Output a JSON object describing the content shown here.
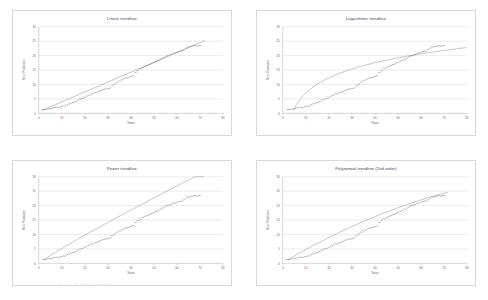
{
  "figure": {
    "caption": "Figure 1. Trendline comparison",
    "panel_count": 4
  },
  "axis": {
    "xlabel": "Years",
    "ylabel": "New Positions",
    "x_ticks": [
      "0",
      "10",
      "20",
      "30",
      "40",
      "50",
      "60",
      "70",
      "80"
    ],
    "y_ticks": [
      "0",
      "5",
      "10",
      "15",
      "20",
      "25",
      "30"
    ],
    "xlim": [
      0,
      80
    ],
    "ylim": [
      0,
      30
    ],
    "gridline_color": "#c8c8c8",
    "axis_color": "#9a9a9a",
    "marker_color": "#3a3a3a",
    "trendline_color": "#7d7d7d"
  },
  "chart_data": [
    {
      "type": "scatter",
      "title": "Linear trendline",
      "xlabel": "Years",
      "ylabel": "New Positions",
      "xlim": [
        0,
        80
      ],
      "ylim": [
        0,
        30
      ],
      "grid": true,
      "legend": "none",
      "trend": "linear",
      "x": [
        2,
        3,
        4,
        5,
        6,
        7,
        8,
        9,
        10,
        11,
        12,
        13,
        14,
        15,
        16,
        17,
        18,
        19,
        20,
        21,
        22,
        23,
        24,
        25,
        26,
        27,
        28,
        29,
        30,
        31,
        32,
        33,
        34,
        35,
        36,
        37,
        38,
        39,
        40,
        41,
        42,
        43,
        44,
        45,
        46,
        47,
        48,
        49,
        50,
        51,
        52,
        53,
        54,
        55,
        56,
        57,
        58,
        59,
        60,
        61,
        62,
        63,
        64,
        65,
        66,
        67,
        68,
        69,
        70
      ],
      "y": [
        1.3,
        1.4,
        1.5,
        1.6,
        1.8,
        2.0,
        2.1,
        2.2,
        2.3,
        2.5,
        2.9,
        3.2,
        3.5,
        3.8,
        4.0,
        4.6,
        5.0,
        5.2,
        5.6,
        6.0,
        6.3,
        6.7,
        7.0,
        7.2,
        7.6,
        8.0,
        8.2,
        8.4,
        8.6,
        8.8,
        9.6,
        10.2,
        10.8,
        11.2,
        11.6,
        12.0,
        12.3,
        12.5,
        12.7,
        13.0,
        14.2,
        14.8,
        15.4,
        15.8,
        16.2,
        16.6,
        16.9,
        17.2,
        17.6,
        18.0,
        18.4,
        18.8,
        19.2,
        19.6,
        20.0,
        20.3,
        20.6,
        20.9,
        21.2,
        21.4,
        21.6,
        22.0,
        22.6,
        23.0,
        23.2,
        23.3,
        23.4,
        23.4,
        23.5
      ],
      "trendline": {
        "kind": "linear",
        "y_start": 0.9,
        "y_end": 25.2
      }
    },
    {
      "type": "scatter",
      "title": "Logarithmic trendline",
      "xlabel": "Years",
      "ylabel": "New Positions",
      "xlim": [
        0,
        80
      ],
      "ylim": [
        0,
        30
      ],
      "grid": true,
      "legend": "none",
      "trend": "logarithmic",
      "x": [
        2,
        3,
        4,
        5,
        6,
        7,
        8,
        9,
        10,
        11,
        12,
        13,
        14,
        15,
        16,
        17,
        18,
        19,
        20,
        21,
        22,
        23,
        24,
        25,
        26,
        27,
        28,
        29,
        30,
        31,
        32,
        33,
        34,
        35,
        36,
        37,
        38,
        39,
        40,
        41,
        42,
        43,
        44,
        45,
        46,
        47,
        48,
        49,
        50,
        51,
        52,
        53,
        54,
        55,
        56,
        57,
        58,
        59,
        60,
        61,
        62,
        63,
        64,
        65,
        66,
        67,
        68,
        69,
        70
      ],
      "y": [
        1.3,
        1.4,
        1.5,
        1.6,
        1.8,
        2.0,
        2.1,
        2.2,
        2.3,
        2.5,
        2.9,
        3.2,
        3.5,
        3.8,
        4.0,
        4.6,
        5.0,
        5.2,
        5.6,
        6.0,
        6.3,
        6.7,
        7.0,
        7.2,
        7.6,
        8.0,
        8.2,
        8.4,
        8.6,
        8.8,
        9.6,
        10.2,
        10.8,
        11.2,
        11.6,
        12.0,
        12.3,
        12.5,
        12.7,
        13.0,
        14.2,
        14.8,
        15.4,
        15.8,
        16.2,
        16.6,
        16.9,
        17.2,
        17.6,
        18.0,
        18.4,
        18.8,
        19.2,
        19.6,
        20.0,
        20.3,
        20.6,
        20.9,
        21.2,
        21.4,
        21.6,
        22.0,
        22.6,
        23.0,
        23.2,
        23.3,
        23.4,
        23.4,
        23.5
      ],
      "trendline": {
        "kind": "logarithmic",
        "coef_a": 7.6,
        "coef_b": -10.5,
        "x_start": 4.5,
        "x_end": 80
      }
    },
    {
      "type": "scatter",
      "title": "Power trendline",
      "xlabel": "Years",
      "ylabel": "New Positions",
      "xlim": [
        0,
        80
      ],
      "ylim": [
        0,
        30
      ],
      "grid": true,
      "legend": "none",
      "trend": "power",
      "x": [
        2,
        3,
        4,
        5,
        6,
        7,
        8,
        9,
        10,
        11,
        12,
        13,
        14,
        15,
        16,
        17,
        18,
        19,
        20,
        21,
        22,
        23,
        24,
        25,
        26,
        27,
        28,
        29,
        30,
        31,
        32,
        33,
        34,
        35,
        36,
        37,
        38,
        39,
        40,
        41,
        42,
        43,
        44,
        45,
        46,
        47,
        48,
        49,
        50,
        51,
        52,
        53,
        54,
        55,
        56,
        57,
        58,
        59,
        60,
        61,
        62,
        63,
        64,
        65,
        66,
        67,
        68,
        69,
        70
      ],
      "y": [
        1.3,
        1.4,
        1.5,
        1.6,
        1.8,
        2.0,
        2.1,
        2.2,
        2.3,
        2.5,
        2.9,
        3.2,
        3.5,
        3.8,
        4.0,
        4.6,
        5.0,
        5.2,
        5.6,
        6.0,
        6.3,
        6.7,
        7.0,
        7.2,
        7.6,
        8.0,
        8.2,
        8.4,
        8.6,
        8.8,
        9.6,
        10.2,
        10.8,
        11.2,
        11.6,
        12.0,
        12.3,
        12.5,
        12.7,
        13.0,
        14.2,
        14.8,
        15.4,
        15.8,
        16.2,
        16.6,
        16.9,
        17.2,
        17.6,
        18.0,
        18.4,
        18.8,
        19.2,
        19.6,
        20.0,
        20.3,
        20.6,
        20.9,
        21.2,
        21.4,
        21.6,
        22.0,
        22.6,
        23.0,
        23.2,
        23.3,
        23.4,
        23.4,
        23.5
      ],
      "trendline": {
        "kind": "power",
        "coef_a": 0.62,
        "coef_b": 0.92,
        "x_start": 2,
        "x_end": 72
      }
    },
    {
      "type": "scatter",
      "title": "Polynomial trendline (2nd order)",
      "xlabel": "Years",
      "ylabel": "New Positions",
      "xlim": [
        0,
        80
      ],
      "ylim": [
        0,
        30
      ],
      "grid": true,
      "legend": "none",
      "trend": "polynomial2",
      "x": [
        2,
        3,
        4,
        5,
        6,
        7,
        8,
        9,
        10,
        11,
        12,
        13,
        14,
        15,
        16,
        17,
        18,
        19,
        20,
        21,
        22,
        23,
        24,
        25,
        26,
        27,
        28,
        29,
        30,
        31,
        32,
        33,
        34,
        35,
        36,
        37,
        38,
        39,
        40,
        41,
        42,
        43,
        44,
        45,
        46,
        47,
        48,
        49,
        50,
        51,
        52,
        53,
        54,
        55,
        56,
        57,
        58,
        59,
        60,
        61,
        62,
        63,
        64,
        65,
        66,
        67,
        68,
        69,
        70
      ],
      "y": [
        1.3,
        1.4,
        1.5,
        1.6,
        1.8,
        2.0,
        2.1,
        2.2,
        2.3,
        2.5,
        2.9,
        3.2,
        3.5,
        3.8,
        4.0,
        4.6,
        5.0,
        5.2,
        5.6,
        6.0,
        6.3,
        6.7,
        7.0,
        7.2,
        7.6,
        8.0,
        8.2,
        8.4,
        8.6,
        8.8,
        9.6,
        10.2,
        10.8,
        11.2,
        11.6,
        12.0,
        12.3,
        12.5,
        12.7,
        13.0,
        14.2,
        14.8,
        15.4,
        15.8,
        16.2,
        16.6,
        16.9,
        17.2,
        17.6,
        18.0,
        18.4,
        18.8,
        19.2,
        19.6,
        20.0,
        20.3,
        20.6,
        20.9,
        21.2,
        21.4,
        21.6,
        22.0,
        22.6,
        23.0,
        23.2,
        23.3,
        23.4,
        23.4,
        23.5
      ],
      "trendline": {
        "kind": "polynomial2",
        "coef_a": -0.0018,
        "coef_b": 0.47,
        "coef_c": 0.25,
        "x_start": 2,
        "x_end": 72
      }
    }
  ]
}
